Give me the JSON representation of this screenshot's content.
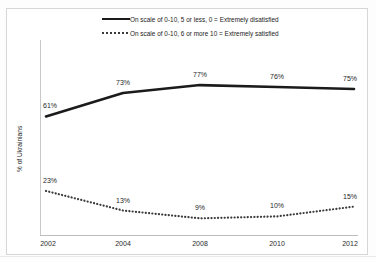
{
  "chart_data": {
    "type": "line",
    "title": "",
    "xlabel": "",
    "ylabel": "% of Ukrainians",
    "categories": [
      "2002",
      "2004",
      "2008",
      "2010",
      "2012"
    ],
    "x": [
      2002,
      2004,
      2008,
      2010,
      2012
    ],
    "ylim": [
      0,
      100
    ],
    "xlim": [
      2002,
      2012
    ],
    "grid": false,
    "legend_position": "top-center",
    "series": [
      {
        "name": "On scale of 0-10,  5 or less, 0 = Extremely disatisfied",
        "style": "solid",
        "color": "#1b1b1b",
        "values": [
          61,
          73,
          77,
          76,
          75
        ],
        "labels": [
          "61%",
          "73%",
          "77%",
          "76%",
          "75%"
        ]
      },
      {
        "name": "On scale of 0-10, 6 or more 10 = Extremely satisfied",
        "style": "dotted",
        "color": "#3a3a3a",
        "values": [
          23,
          13,
          9,
          10,
          15
        ],
        "labels": [
          "23%",
          "13%",
          "9%",
          "10%",
          "15%"
        ]
      }
    ]
  },
  "legend": {
    "items": [
      {
        "label": "On scale of 0-10,  5 or less, 0 = Extremely disatisfied",
        "sample": "solid-line-sample"
      },
      {
        "label": "On scale of 0-10, 6 or more 10 = Extremely satisfied",
        "sample": "dotted-line-sample"
      }
    ]
  },
  "axes": {
    "y_title": "% of Ukrainians",
    "x_ticks": [
      "2002",
      "2004",
      "2008",
      "2010",
      "2012"
    ]
  },
  "colors": {
    "series_solid": "#1b1b1b",
    "series_dotted": "#3a3a3a",
    "axis": "#c9c9c9",
    "frame": "#d6d6d6",
    "text": "#222222",
    "background": "#ffffff"
  }
}
